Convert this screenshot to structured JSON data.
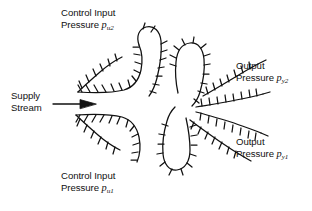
{
  "figure": {
    "kind": "fluidic-amplifier-schematic",
    "background_color": "#ffffff",
    "ink_color": "#111111",
    "width": 312,
    "height": 211
  },
  "labels": {
    "control_input_2": {
      "line1": "Control Input",
      "line2_prefix": "Pressure ",
      "symbol": "p",
      "subscript": "u2"
    },
    "control_input_1": {
      "line1": "Control Input",
      "line2_prefix": "Pressure ",
      "symbol": "p",
      "subscript": "u1"
    },
    "output_2": {
      "line1": "Output",
      "line2_prefix": "Pressure ",
      "symbol": "p",
      "subscript": "y2"
    },
    "output_1": {
      "line1": "Output",
      "line2_prefix": "Pressure ",
      "symbol": "p",
      "subscript": "y1"
    },
    "supply_stream": {
      "line1": "Supply",
      "line2": "Stream"
    }
  },
  "annotations": {
    "supply_arrow": "arrow-right-icon"
  }
}
